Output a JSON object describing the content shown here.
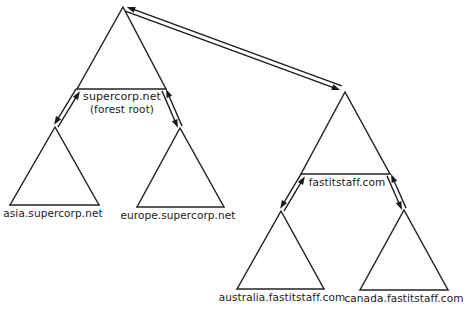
{
  "diagram": {
    "background_color": "#ffffff",
    "line_color": "#242424",
    "text_color": "#1b1b1b",
    "nodes": [
      {
        "id": "supercorp",
        "label": "supercorp.net",
        "sublabel": "(forest root)",
        "apex": {
          "x": 123,
          "y": 7
        },
        "base_left": {
          "x": 77,
          "y": 89
        },
        "base_right": {
          "x": 166,
          "y": 89
        },
        "label_anchor": {
          "x": 122,
          "y": 91
        }
      },
      {
        "id": "asia",
        "label": "asia.supercorp.net",
        "sublabel": "",
        "apex": {
          "x": 55,
          "y": 127
        },
        "base_left": {
          "x": 10,
          "y": 205
        },
        "base_right": {
          "x": 99,
          "y": 205
        },
        "label_anchor": {
          "x": 53,
          "y": 207
        }
      },
      {
        "id": "europe",
        "label": "europe.supercorp.net",
        "sublabel": "",
        "apex": {
          "x": 180,
          "y": 128
        },
        "base_left": {
          "x": 137,
          "y": 207
        },
        "base_right": {
          "x": 224,
          "y": 207
        },
        "label_anchor": {
          "x": 178,
          "y": 209
        }
      },
      {
        "id": "fastitstaff",
        "label": "fastitstaff.com",
        "sublabel": "",
        "apex": {
          "x": 345,
          "y": 92
        },
        "base_left": {
          "x": 301,
          "y": 174
        },
        "base_right": {
          "x": 390,
          "y": 174
        },
        "label_anchor": {
          "x": 347,
          "y": 176
        }
      },
      {
        "id": "australia",
        "label": "australia.fastitstaff.com",
        "sublabel": "",
        "apex": {
          "x": 281,
          "y": 211
        },
        "base_left": {
          "x": 237,
          "y": 289
        },
        "base_right": {
          "x": 324,
          "y": 289
        },
        "label_anchor": {
          "x": 282,
          "y": 291
        }
      },
      {
        "id": "canada",
        "label": "canada.fastitstaff.com",
        "sublabel": "",
        "apex": {
          "x": 404,
          "y": 210
        },
        "base_left": {
          "x": 360,
          "y": 290
        },
        "base_right": {
          "x": 448,
          "y": 290
        },
        "label_anchor": {
          "x": 404,
          "y": 292
        }
      }
    ],
    "trusts": [
      {
        "id": "supercorp-fastitstaff",
        "from": "supercorp",
        "to": "fastitstaff",
        "kind": "two-way-forest-trust",
        "from_point": {
          "x": 126,
          "y": 9
        },
        "to_point": {
          "x": 341,
          "y": 88
        }
      },
      {
        "id": "supercorp-asia",
        "from": "supercorp",
        "to": "asia",
        "kind": "two-way-parent-child-trust",
        "from_point": {
          "x": 78,
          "y": 90
        },
        "to_point": {
          "x": 56,
          "y": 126
        }
      },
      {
        "id": "supercorp-europe",
        "from": "supercorp",
        "to": "europe",
        "kind": "two-way-parent-child-trust",
        "from_point": {
          "x": 164,
          "y": 90
        },
        "to_point": {
          "x": 180,
          "y": 127
        }
      },
      {
        "id": "fastitstaff-australia",
        "from": "fastitstaff",
        "to": "australia",
        "kind": "two-way-parent-child-trust",
        "from_point": {
          "x": 303,
          "y": 175
        },
        "to_point": {
          "x": 282,
          "y": 210
        }
      },
      {
        "id": "fastitstaff-canada",
        "from": "fastitstaff",
        "to": "canada",
        "kind": "two-way-parent-child-trust",
        "from_point": {
          "x": 389,
          "y": 175
        },
        "to_point": {
          "x": 404,
          "y": 209
        }
      }
    ]
  }
}
